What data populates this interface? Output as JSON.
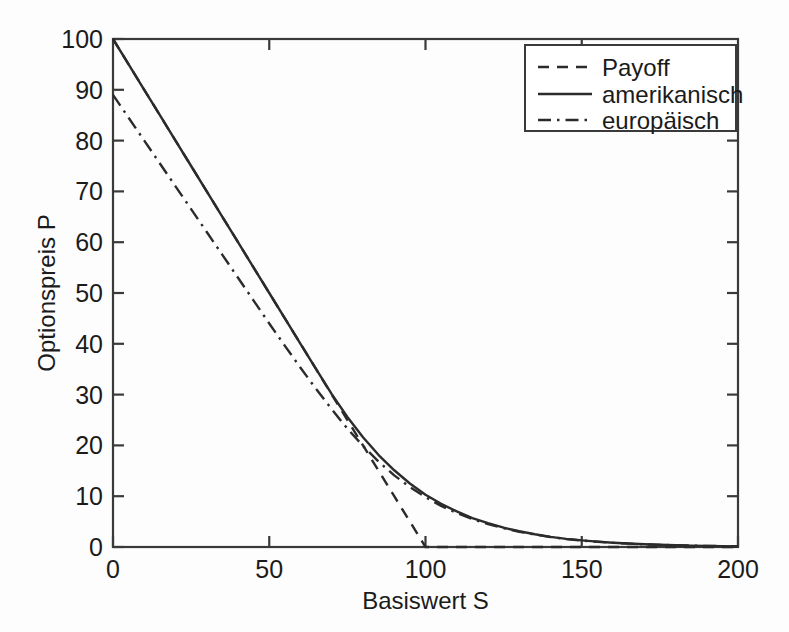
{
  "figure": {
    "background": "#fdfdfd",
    "ink_color": "#2b2b2b"
  },
  "axes": {
    "x_title": "Basiswert S",
    "y_title": "Optionspreis P",
    "x_ticks": [
      "0",
      "50",
      "100",
      "150",
      "200"
    ],
    "y_ticks": [
      "0",
      "10",
      "20",
      "30",
      "40",
      "50",
      "60",
      "70",
      "80",
      "90",
      "100"
    ]
  },
  "legend": {
    "entries": [
      {
        "label": "Payoff",
        "style": "dashed"
      },
      {
        "label": "amerikanisch",
        "style": "solid"
      },
      {
        "label": "europäisch",
        "style": "dashdot"
      }
    ]
  },
  "chart_data": {
    "type": "line",
    "title": "",
    "xlabel": "Basiswert S",
    "ylabel": "Optionspreis P",
    "xlim": [
      0,
      200
    ],
    "ylim": [
      0,
      100
    ],
    "xticks": [
      0,
      50,
      100,
      150,
      200
    ],
    "yticks": [
      0,
      10,
      20,
      30,
      40,
      50,
      60,
      70,
      80,
      90,
      100
    ],
    "grid": false,
    "legend_position": "upper right",
    "x": [
      0,
      5,
      10,
      15,
      20,
      25,
      30,
      35,
      40,
      45,
      50,
      55,
      60,
      65,
      70,
      75,
      80,
      85,
      90,
      95,
      100,
      105,
      110,
      115,
      120,
      125,
      130,
      135,
      140,
      145,
      150,
      155,
      160,
      165,
      170,
      175,
      180,
      185,
      190,
      195,
      200
    ],
    "series": [
      {
        "name": "Payoff",
        "style": "dashed",
        "values": [
          100,
          95,
          90,
          85,
          80,
          75,
          70,
          65,
          60,
          55,
          50,
          45,
          40,
          35,
          30,
          25,
          20,
          15,
          10,
          5,
          0,
          0,
          0,
          0,
          0,
          0,
          0,
          0,
          0,
          0,
          0,
          0,
          0,
          0,
          0,
          0,
          0,
          0,
          0,
          0,
          0
        ]
      },
      {
        "name": "amerikanisch",
        "style": "solid",
        "values": [
          100,
          95,
          90,
          85,
          80,
          75,
          70,
          65,
          60,
          55,
          50,
          45,
          40,
          35,
          30.1,
          25.6,
          21.6,
          18.1,
          15.1,
          12.5,
          10.3,
          8.5,
          7.0,
          5.7,
          4.7,
          3.8,
          3.1,
          2.5,
          2.0,
          1.6,
          1.3,
          1.05,
          0.85,
          0.68,
          0.55,
          0.44,
          0.35,
          0.28,
          0.22,
          0.17,
          0.13
        ]
      },
      {
        "name": "europäisch",
        "style": "dashdot",
        "values": [
          89,
          84.5,
          80,
          75.5,
          71,
          66.5,
          62,
          57.5,
          53,
          48.5,
          44,
          39.6,
          35.3,
          31.1,
          27.1,
          23.3,
          19.9,
          16.8,
          14.1,
          11.8,
          9.8,
          8.1,
          6.7,
          5.5,
          4.5,
          3.7,
          3.0,
          2.45,
          1.97,
          1.58,
          1.27,
          1.02,
          0.82,
          0.66,
          0.53,
          0.42,
          0.34,
          0.27,
          0.21,
          0.17,
          0.13
        ]
      }
    ],
    "annotations": [
      "Payoff of a put with strike 100; vanishes for S >= 100",
      "American put price touches the payoff for small S (early exercise region)",
      "European put price starts near 89 at S = 0 (discounted strike)"
    ]
  }
}
